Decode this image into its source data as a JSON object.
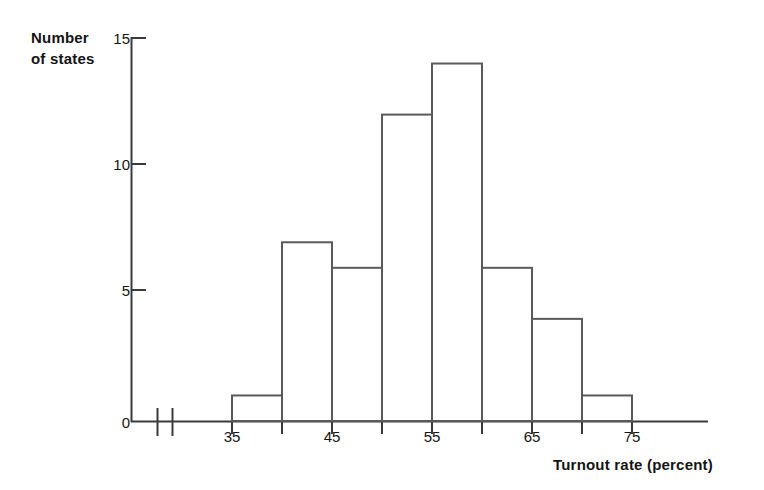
{
  "chart_data": {
    "type": "bar",
    "title": "",
    "subtitle": "",
    "xlabel": "Turnout rate (percent)",
    "ylabel_line1": "Number",
    "ylabel_line2": "of states",
    "ylabel": "Number of states",
    "categories": [
      "35-40",
      "40-45",
      "45-50",
      "50-55",
      "55-60",
      "60-65",
      "65-70",
      "70-75"
    ],
    "bin_edges": [
      35,
      40,
      45,
      50,
      55,
      60,
      65,
      70,
      75
    ],
    "values": [
      1,
      7,
      6,
      12,
      14,
      6,
      4,
      1
    ],
    "xlim": [
      30,
      80
    ],
    "ylim": [
      0,
      15
    ],
    "xticks": [
      35,
      40,
      45,
      50,
      55,
      60,
      65,
      70,
      75
    ],
    "xtick_labels": [
      "35",
      "",
      "45",
      "",
      "55",
      "",
      "65",
      "",
      "75"
    ],
    "xtick_labels_shown": [
      "35",
      "45",
      "55",
      "65",
      "75"
    ],
    "yticks": [
      0,
      5,
      10,
      15
    ],
    "ytick_labels": [
      "0",
      "5",
      "10",
      "15"
    ],
    "grid": false,
    "legend": false,
    "axis_break": true,
    "bar_fill": "#ffffff",
    "bar_stroke": "#5a5a5a",
    "axis_color": "#3a3a3a",
    "text_color": "#141414"
  },
  "axes": {
    "x_axis_name": "x-axis",
    "y_axis_name": "y-axis",
    "break_marker_name": "axis-break-marker"
  }
}
